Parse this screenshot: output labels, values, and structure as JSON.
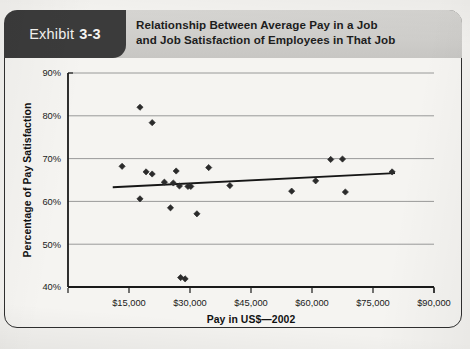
{
  "exhibit": {
    "word": "Exhibit",
    "number": "3-3"
  },
  "header": {
    "title_line1": "Relationship Between Average Pay in a Job",
    "title_line2": "and Job Satisfaction of Employees in That Job"
  },
  "colors": {
    "tag_background": "#3b3b3b",
    "header_band": "#cfcecb",
    "page_background": "#f3f2ef",
    "marker": "#2b2b2b",
    "trendline": "#161616",
    "gridline": "#8e8e8e",
    "axis": "#1a1a1a"
  },
  "chart_data": {
    "type": "scatter",
    "title": "Relationship Between Average Pay in a Job and Job Satisfaction of Employees in That Job",
    "xlabel": "Pay in US$—2002",
    "ylabel": "Percentage of Pay Satisfaction",
    "xlim": [
      0,
      90000
    ],
    "ylim": [
      40,
      90
    ],
    "xticks": [
      0,
      15000,
      30000,
      45000,
      60000,
      75000,
      90000
    ],
    "xtick_labels": [
      "",
      "$15,000",
      "$30,000",
      "$45,000",
      "$60,000",
      "$75,000",
      "$90,000"
    ],
    "yticks": [
      40,
      50,
      60,
      70,
      80,
      90
    ],
    "ytick_labels": [
      "40%",
      "50%",
      "60%",
      "70%",
      "80%",
      "90%"
    ],
    "grid": true,
    "grid_axis": "y",
    "legend": false,
    "marker_shape": "diamond",
    "points": [
      {
        "x": 13300,
        "y": 68.2
      },
      {
        "x": 17700,
        "y": 82.0
      },
      {
        "x": 17700,
        "y": 60.6
      },
      {
        "x": 19200,
        "y": 66.9
      },
      {
        "x": 20700,
        "y": 78.4
      },
      {
        "x": 20700,
        "y": 66.4
      },
      {
        "x": 23700,
        "y": 64.5
      },
      {
        "x": 25200,
        "y": 58.5
      },
      {
        "x": 25900,
        "y": 64.3
      },
      {
        "x": 26600,
        "y": 67.1
      },
      {
        "x": 27400,
        "y": 63.6
      },
      {
        "x": 27700,
        "y": 42.2
      },
      {
        "x": 28800,
        "y": 41.9
      },
      {
        "x": 29500,
        "y": 63.5
      },
      {
        "x": 30200,
        "y": 63.5
      },
      {
        "x": 31700,
        "y": 57.1
      },
      {
        "x": 34600,
        "y": 67.9
      },
      {
        "x": 39800,
        "y": 63.7
      },
      {
        "x": 55000,
        "y": 62.4
      },
      {
        "x": 60900,
        "y": 64.8
      },
      {
        "x": 64600,
        "y": 69.8
      },
      {
        "x": 67500,
        "y": 69.9
      },
      {
        "x": 68200,
        "y": 62.2
      },
      {
        "x": 79700,
        "y": 66.9
      }
    ],
    "trendline": {
      "x_start": 11000,
      "y_start": 63.3,
      "x_end": 80400,
      "y_end": 66.6
    }
  }
}
